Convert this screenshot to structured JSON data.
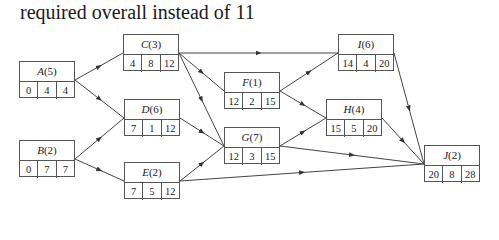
{
  "heading": "required overall instead of 11",
  "nodes": {
    "A": {
      "letter": "A",
      "duration": "(5)",
      "values": [
        "0",
        "4",
        "4"
      ]
    },
    "B": {
      "letter": "B",
      "duration": "(2)",
      "values": [
        "0",
        "7",
        "7"
      ]
    },
    "C": {
      "letter": "C",
      "duration": "(3)",
      "values": [
        "4",
        "8",
        "12"
      ]
    },
    "D": {
      "letter": "D",
      "duration": "(6)",
      "values": [
        "7",
        "1",
        "12"
      ]
    },
    "E": {
      "letter": "E",
      "duration": "(2)",
      "values": [
        "7",
        "5",
        "12"
      ]
    },
    "F": {
      "letter": "F",
      "duration": "(1)",
      "values": [
        "12",
        "2",
        "15"
      ]
    },
    "G": {
      "letter": "G",
      "duration": "(7)",
      "values": [
        "12",
        "3",
        "15"
      ]
    },
    "H": {
      "letter": "H",
      "duration": "(4)",
      "values": [
        "15",
        "5",
        "20"
      ]
    },
    "I": {
      "letter": "I",
      "duration": "(6)",
      "values": [
        "14",
        "4",
        "20"
      ]
    },
    "J": {
      "letter": "J",
      "duration": "(2)",
      "values": [
        "20",
        "8",
        "28"
      ]
    }
  },
  "edges": [
    [
      "A",
      "C"
    ],
    [
      "A",
      "D"
    ],
    [
      "B",
      "D"
    ],
    [
      "B",
      "E"
    ],
    [
      "C",
      "I"
    ],
    [
      "C",
      "F"
    ],
    [
      "C",
      "G"
    ],
    [
      "D",
      "G"
    ],
    [
      "E",
      "G"
    ],
    [
      "E",
      "J"
    ],
    [
      "F",
      "I"
    ],
    [
      "F",
      "H"
    ],
    [
      "G",
      "H"
    ],
    [
      "G",
      "J"
    ],
    [
      "I",
      "J"
    ],
    [
      "H",
      "J"
    ]
  ],
  "colors": {
    "line": "#444444",
    "border": "#555555"
  }
}
